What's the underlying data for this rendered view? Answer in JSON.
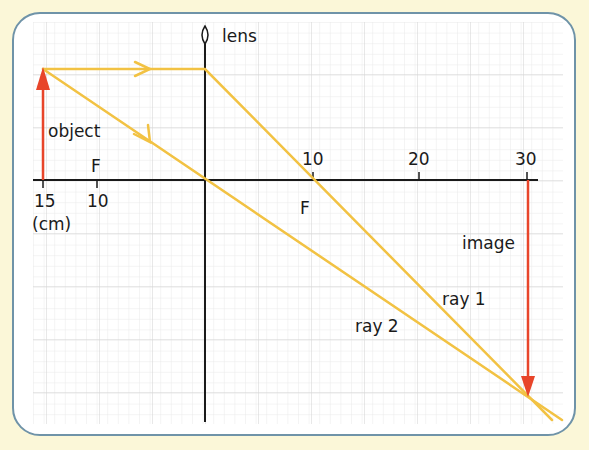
{
  "diagram": {
    "labels": {
      "lens": "lens",
      "object": "object",
      "image": "image",
      "ray1": "ray 1",
      "ray2": "ray 2",
      "focus_left": "F",
      "focus_right": "F",
      "unit": "(cm)"
    },
    "axis_ticks_left": [
      "15",
      "10"
    ],
    "axis_ticks_right": [
      "10",
      "20",
      "30"
    ],
    "colors": {
      "ray": "#f2c243",
      "arrow": "#e8452a",
      "axis": "#1a1a1a",
      "grid_minor": "#e4e4e4",
      "grid_major": "#cfcfcf",
      "panel_border": "#6f93a8",
      "background": "#fbf7d8"
    },
    "geometry": {
      "object_distance_cm": 15,
      "focal_length_cm": 10,
      "image_distance_cm": 30
    }
  }
}
